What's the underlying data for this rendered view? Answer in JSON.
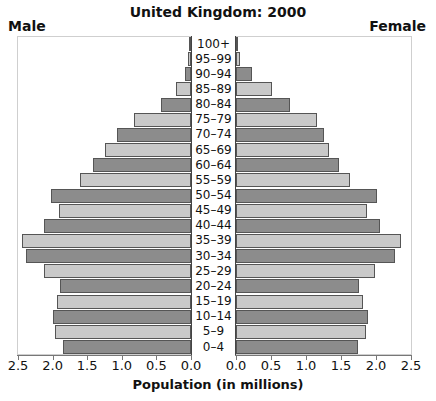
{
  "chart_data": {
    "type": "bar",
    "subtype": "population-pyramid",
    "title": "United Kingdom: 2000",
    "xlabel": "Population (in millions)",
    "ylabel": "",
    "legend": {
      "left": "Male",
      "right": "Female"
    },
    "categories": [
      "100+",
      "95–99",
      "90–94",
      "85–89",
      "80–84",
      "75–79",
      "70–74",
      "65–69",
      "60–64",
      "55–59",
      "50–54",
      "45–49",
      "40–44",
      "35–39",
      "30–34",
      "25–29",
      "20–24",
      "15–19",
      "10–14",
      "5–9",
      "0–4"
    ],
    "series": [
      {
        "name": "Male",
        "values": [
          0.02,
          0.04,
          0.09,
          0.22,
          0.44,
          0.82,
          1.07,
          1.24,
          1.42,
          1.61,
          2.03,
          1.91,
          2.13,
          2.44,
          2.38,
          2.12,
          1.89,
          1.93,
          1.99,
          1.97,
          1.85
        ]
      },
      {
        "name": "Female",
        "values": [
          0.01,
          0.05,
          0.23,
          0.52,
          0.77,
          1.16,
          1.26,
          1.33,
          1.47,
          1.63,
          2.02,
          1.87,
          2.05,
          2.35,
          2.27,
          1.99,
          1.76,
          1.81,
          1.88,
          1.85,
          1.74
        ]
      }
    ],
    "xlim": [
      0,
      2.5
    ],
    "left_ticks": [
      "2.5",
      "2.0",
      "1.5",
      "1.0",
      "0.5",
      "0.0"
    ],
    "right_ticks": [
      "0.0",
      "0.5",
      "1.0",
      "1.5",
      "2.0",
      "2.5"
    ],
    "grid": false,
    "colors": {
      "dark_bar": "#8c8c8c",
      "light_bar": "#c9c9c9",
      "outline": "#555555"
    }
  }
}
